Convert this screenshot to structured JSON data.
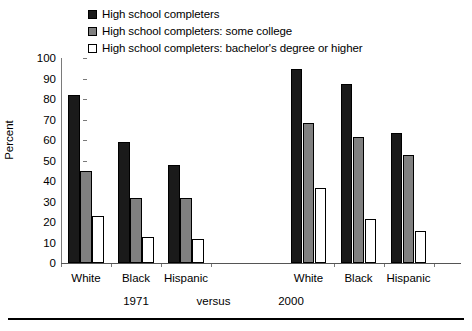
{
  "chart_data": {
    "type": "bar",
    "title": "",
    "xlabel": "",
    "ylabel": "Percent",
    "ylim": [
      0,
      100
    ],
    "yticks": [
      0,
      10,
      20,
      30,
      40,
      50,
      60,
      70,
      80,
      90,
      100
    ],
    "grid": false,
    "legend_position": "top",
    "categories": [
      "White",
      "Black",
      "Hispanic",
      "White",
      "Black",
      "Hispanic"
    ],
    "group_labels": [
      "1971",
      "versus",
      "2000"
    ],
    "series": [
      {
        "name": "High school completers",
        "color": "#1a1a1a",
        "values": [
          82,
          59,
          48,
          94.5,
          87.5,
          63.5
        ]
      },
      {
        "name": "High school completers: some college",
        "color": "#808080",
        "values": [
          45,
          31.5,
          31.5,
          68.5,
          61.5,
          52.5
        ]
      },
      {
        "name": "High school completers: bachelor's degree or higher",
        "color": "#ffffff",
        "values": [
          23,
          12.5,
          11.5,
          36.5,
          21.5,
          15.5
        ]
      }
    ]
  },
  "legend": {
    "items": [
      {
        "label": "High school completers",
        "swatch": "#1a1a1a"
      },
      {
        "label": "High school completers: some college",
        "swatch": "#808080"
      },
      {
        "label": "High school completers: bachelor's degree or higher",
        "swatch": "#ffffff"
      }
    ]
  },
  "axis": {
    "y_label": "Percent",
    "y_ticks": [
      "100",
      "90",
      "80",
      "70",
      "60",
      "50",
      "40",
      "30",
      "20",
      "10",
      "0"
    ]
  },
  "x_categories": [
    "White",
    "Black",
    "Hispanic",
    "White",
    "Black",
    "Hispanic"
  ],
  "era_row": [
    "1971",
    "versus",
    "2000"
  ]
}
